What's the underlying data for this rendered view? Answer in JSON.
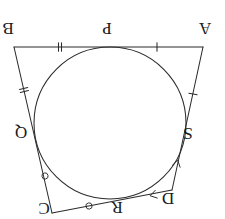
{
  "figure": {
    "orientation": "rotated-180",
    "background_color": "#ffffff",
    "stroke_color": "#2b2b2b"
  },
  "vertices": [
    {
      "id": "A",
      "label": "A",
      "x": 203,
      "y": 47,
      "label_x": 205,
      "label_y": 33
    },
    {
      "id": "B",
      "label": "B",
      "x": 14,
      "y": 47,
      "label_x": 8,
      "label_y": 33
    },
    {
      "id": "C",
      "label": "C",
      "x": 52,
      "y": 213,
      "label_x": 44,
      "label_y": 213
    },
    {
      "id": "D",
      "label": "D",
      "x": 172,
      "y": 190,
      "label_x": 168,
      "label_y": 203
    }
  ],
  "tangent_points": [
    {
      "id": "P",
      "label": "P",
      "x": 111,
      "y": 47,
      "label_x": 107,
      "label_y": 33,
      "on_side": "AB"
    },
    {
      "id": "Q",
      "label": "Q",
      "x": 34,
      "y": 130,
      "label_x": 21,
      "label_y": 137,
      "on_side": "BC"
    },
    {
      "id": "R",
      "label": "R",
      "x": 119,
      "y": 203,
      "label_x": 117,
      "label_y": 212,
      "on_side": "CD"
    },
    {
      "id": "S",
      "label": "S",
      "x": 186,
      "y": 132,
      "label_x": 188,
      "label_y": 138,
      "on_side": "DA"
    }
  ],
  "incircle": {
    "center_x": 110,
    "center_y": 123,
    "radius": 76,
    "label": "inscribed circle"
  },
  "segment_marks": [
    {
      "segment": "B-P",
      "style": "double-tick",
      "x": 60,
      "y": 47,
      "count": 2
    },
    {
      "segment": "P-A",
      "style": "single-tick",
      "x": 157,
      "y": 47,
      "count": 1
    },
    {
      "segment": "B-Q",
      "style": "double-tick",
      "x": 24,
      "y": 90,
      "count": 2
    },
    {
      "segment": "A-S",
      "style": "single-tick",
      "x": 193,
      "y": 94,
      "count": 1
    },
    {
      "segment": "Q-C",
      "style": "circle",
      "x": 45,
      "y": 176,
      "count": 1
    },
    {
      "segment": "C-R",
      "style": "circle",
      "x": 89,
      "y": 206,
      "count": 1
    },
    {
      "segment": "R-D",
      "style": "chevron",
      "x": 153,
      "y": 195,
      "count": 1
    },
    {
      "segment": "S-D",
      "style": "chevron",
      "x": 177,
      "y": 163,
      "count": 1
    }
  ],
  "sides": [
    {
      "name": "AB",
      "from": "B",
      "to": "A",
      "touches": "P"
    },
    {
      "name": "BC",
      "from": "B",
      "to": "C",
      "touches": "Q"
    },
    {
      "name": "CD",
      "from": "C",
      "to": "D",
      "touches": "R"
    },
    {
      "name": "DA",
      "from": "D",
      "to": "A",
      "touches": "S"
    }
  ]
}
